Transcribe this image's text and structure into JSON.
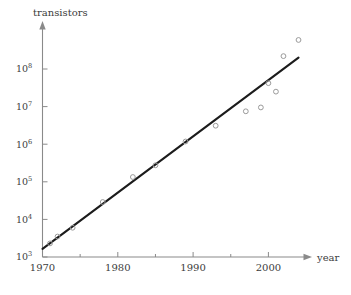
{
  "chart_data": {
    "type": "scatter",
    "title": "",
    "subtitle": "",
    "xlabel": "year",
    "ylabel": "transistors",
    "yscale": "log",
    "xscale": "linear",
    "grid": false,
    "legend": null,
    "xlim": [
      1970,
      2005.9
    ],
    "ylim": [
      1000,
      600000000
    ],
    "xticks": [
      1970,
      1980,
      1990,
      2000
    ],
    "xtick_labels": [
      "1970",
      "1980",
      "1990",
      "2000"
    ],
    "xminor_ticks": [
      1975,
      1985,
      1995,
      2005
    ],
    "yticks": [
      1000,
      10000,
      100000,
      1000000,
      10000000,
      100000000
    ],
    "ytick_labels": [
      "10³",
      "10⁴",
      "10⁵",
      "10⁶",
      "10⁷",
      "10⁸"
    ],
    "ytick_mantissas": [
      "10",
      "10",
      "10",
      "10",
      "10",
      "10"
    ],
    "ytick_exponents": [
      "3",
      "4",
      "5",
      "6",
      "7",
      "8"
    ],
    "series": [
      {
        "name": "transistor counts",
        "marker": "open-circle",
        "marker_color": "#9a9a9a",
        "points": [
          {
            "x": 1971,
            "y": 2300
          },
          {
            "x": 1972,
            "y": 3500
          },
          {
            "x": 1974,
            "y": 6000
          },
          {
            "x": 1978,
            "y": 29000
          },
          {
            "x": 1982,
            "y": 134000
          },
          {
            "x": 1985,
            "y": 275000
          },
          {
            "x": 1989,
            "y": 1180000
          },
          {
            "x": 1993,
            "y": 3100000
          },
          {
            "x": 1997,
            "y": 7500000
          },
          {
            "x": 1999,
            "y": 9500000
          },
          {
            "x": 2000,
            "y": 42000000
          },
          {
            "x": 2001,
            "y": 25000000
          },
          {
            "x": 2002,
            "y": 220000000
          },
          {
            "x": 2004,
            "y": 592000000
          }
        ]
      }
    ],
    "trend_line": {
      "name": "Moore's law fit",
      "color": "#1c1c1c",
      "x_start": 1970,
      "y_start": 1650,
      "x_end": 2004,
      "y_end": 200000000
    }
  },
  "axes": {
    "y_axis_name": "transistors",
    "x_axis_name": "year"
  }
}
